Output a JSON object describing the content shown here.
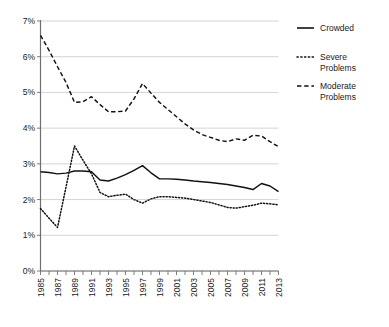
{
  "chart_data": {
    "type": "line",
    "title": "",
    "subtitle": "",
    "xlabel": "",
    "ylabel": "",
    "xlim": [
      1985,
      2013
    ],
    "ylim": [
      0,
      7
    ],
    "grid": true,
    "legend_position": "right",
    "y_tick_labels": [
      "7%",
      "6%",
      "5%",
      "4%",
      "3%",
      "2%",
      "1%",
      "0%"
    ],
    "y_tick_values": [
      7,
      6,
      5,
      4,
      3,
      2,
      1,
      0
    ],
    "x_tick_labels": [
      "1985",
      "1987",
      "1989",
      "1991",
      "1993",
      "1995",
      "1997",
      "1999",
      "2001",
      "2003",
      "2005",
      "2007",
      "2009",
      "2011",
      "2013"
    ],
    "x": [
      1985,
      1986,
      1987,
      1988,
      1989,
      1990,
      1991,
      1992,
      1993,
      1994,
      1995,
      1996,
      1997,
      1998,
      1999,
      2000,
      2001,
      2002,
      2003,
      2004,
      2005,
      2006,
      2007,
      2008,
      2009,
      2010,
      2011,
      2012,
      2013
    ],
    "series": [
      {
        "name": "Crowded",
        "style": "solid",
        "color": "#111111",
        "values": [
          2.78,
          2.76,
          2.72,
          2.74,
          2.8,
          2.8,
          2.78,
          2.55,
          2.52,
          2.6,
          2.7,
          2.82,
          2.95,
          2.75,
          2.58,
          2.58,
          2.57,
          2.55,
          2.52,
          2.5,
          2.48,
          2.45,
          2.42,
          2.38,
          2.34,
          2.28,
          2.45,
          2.38,
          2.22
        ]
      },
      {
        "name": "Severe Problems",
        "style": "dotted",
        "color": "#111111",
        "values": [
          1.75,
          1.48,
          1.22,
          2.35,
          3.5,
          3.1,
          2.72,
          2.2,
          2.08,
          2.12,
          2.15,
          2.0,
          1.9,
          2.02,
          2.08,
          2.08,
          2.06,
          2.04,
          2.0,
          1.96,
          1.92,
          1.85,
          1.78,
          1.76,
          1.8,
          1.84,
          1.9,
          1.88,
          1.85
        ]
      },
      {
        "name": "Moderate Problems",
        "style": "dashed",
        "color": "#111111",
        "values": [
          6.6,
          6.18,
          5.72,
          5.28,
          4.72,
          4.74,
          4.88,
          4.66,
          4.46,
          4.46,
          4.48,
          4.82,
          5.25,
          4.98,
          4.72,
          4.52,
          4.32,
          4.12,
          3.95,
          3.82,
          3.74,
          3.66,
          3.62,
          3.7,
          3.66,
          3.8,
          3.78,
          3.62,
          3.48
        ]
      }
    ]
  },
  "legend": {
    "items": [
      {
        "label": "Crowded",
        "label2": ""
      },
      {
        "label": "Severe",
        "label2": "Problems"
      },
      {
        "label": "Moderate",
        "label2": "Problems"
      }
    ]
  }
}
